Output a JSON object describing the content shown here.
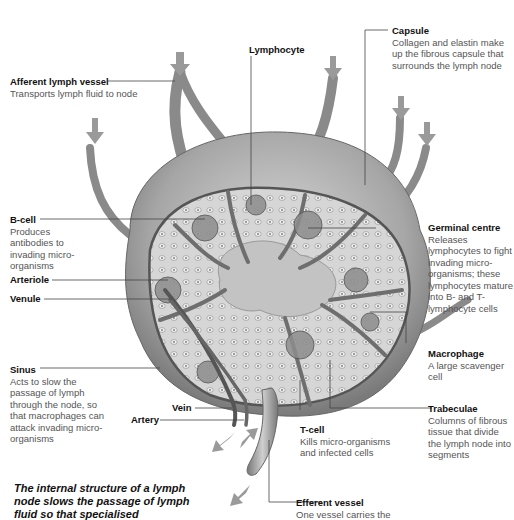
{
  "labels": {
    "lymphocyte": {
      "title": "Lymphocyte"
    },
    "capsule": {
      "title": "Capsule",
      "desc": "Collagen and elastin make up the fibrous capsule that surrounds the lymph node"
    },
    "afferent": {
      "title": "Afferent lymph vessel",
      "desc": "Transports lymph fluid to node"
    },
    "bcell": {
      "title": "B-cell",
      "desc": "Produces antibodies to invading micro-organisms"
    },
    "germinal": {
      "title": "Germinal centre",
      "desc": "Releases lymphocytes to fight invading micro-organisms; these lymphocytes mature into B- and T-lymphocyte cells"
    },
    "arteriole": {
      "title": "Arteriole"
    },
    "venule": {
      "title": "Venule"
    },
    "macrophage": {
      "title": "Macrophage",
      "desc": "A large scavenger cell"
    },
    "sinus": {
      "title": "Sinus",
      "desc": "Acts to slow the passage of lymph through the node, so that macrophages can attack invading micro-organisms"
    },
    "vein": {
      "title": "Vein"
    },
    "artery": {
      "title": "Artery"
    },
    "trabeculae": {
      "title": "Trabeculae",
      "desc": "Columns of fibrous tissue that divide the lymph node into segments"
    },
    "tcell": {
      "title": "T-cell",
      "desc": "Kills micro-organisms and infected cells"
    },
    "efferent": {
      "title": "Efferent vessel",
      "desc": "One vessel carries the"
    }
  },
  "caption": "The internal structure of a lymph node slows the passage of lymph fluid so that specialised",
  "colors": {
    "node_fill": "#bdbdbd",
    "capsule_fill": "#a8a8a8",
    "trabecula": "#6e6e6e",
    "arrow": "#9a9a9a",
    "leader": "#444444"
  }
}
